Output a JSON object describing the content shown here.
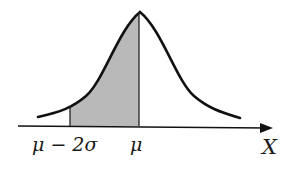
{
  "figure": {
    "type": "normal-distribution-shaded-area",
    "shaded_region": {
      "from": "μ − 2σ",
      "to": "μ",
      "fill": "#b8b8b8"
    },
    "curve_color": "#111111",
    "axis_color": "#111111"
  },
  "labels": {
    "left_bound": "μ − 2σ",
    "mean": "μ",
    "axis": "X"
  }
}
